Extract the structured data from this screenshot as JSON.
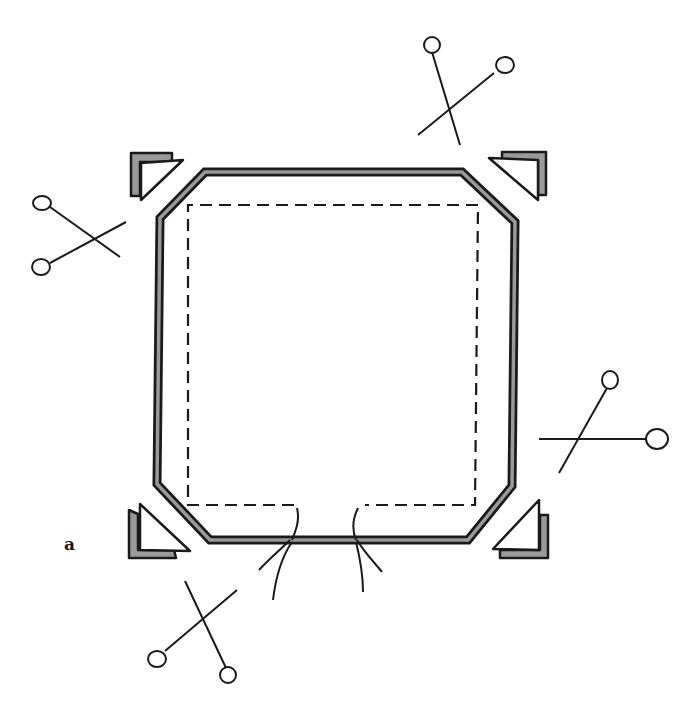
{
  "figure": {
    "label": "a"
  },
  "colors": {
    "ink": "#1a1a1a",
    "fill_gray": "#9a9a9a",
    "background": "#ffffff"
  },
  "elements": {
    "fabric_outline": "octagon-double-line",
    "stitch_line": "dashed",
    "corner_clips": [
      "top-left",
      "top-right",
      "bottom-left",
      "bottom-right"
    ],
    "pins": [
      "top-right",
      "left",
      "right",
      "bottom-left"
    ],
    "thread_tails": [
      "bottom-left-tail",
      "bottom-right-tail"
    ]
  }
}
